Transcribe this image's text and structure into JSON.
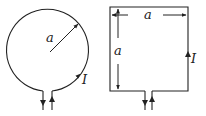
{
  "diagram": {
    "circle_loop": {
      "radius_label": "a",
      "current_label": "I"
    },
    "square_loop": {
      "width_label": "a",
      "height_label": "a",
      "current_label": "I"
    }
  }
}
